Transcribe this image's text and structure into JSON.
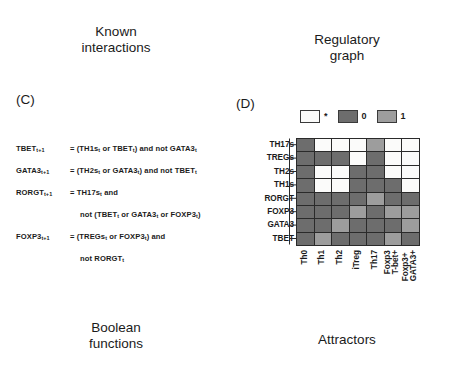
{
  "captions": {
    "known_interactions": "Known\ninteractions",
    "regulatory_graph": "Regulatory\ngraph",
    "boolean_functions": "Boolean\nfunctions",
    "attractors": "Attractors"
  },
  "panels": {
    "c_letter": "(C)",
    "d_letter": "(D)"
  },
  "boolean_functions": [
    {
      "lhs": "TBET",
      "lhs_sub": "t+1",
      "rhs": "= (TH1s<sub>t</sub> or TBET<sub>t</sub>) and not GATA3<sub>t</sub>",
      "continuation": null
    },
    {
      "lhs": "GATA3",
      "lhs_sub": "t+1",
      "rhs": "= (TH2s<sub>t</sub> or GATA3<sub>t</sub>) and not TBET<sub>t</sub>",
      "continuation": null
    },
    {
      "lhs": "RORGT",
      "lhs_sub": "t+1",
      "rhs": "= TH17s<sub>t</sub> and",
      "continuation": "not (TBET<sub>t</sub> or GATA3<sub>t</sub> or FOXP3<sub>t</sub>)"
    },
    {
      "lhs": "FOXP3",
      "lhs_sub": "t+1",
      "rhs": "= (TREGs<sub>t</sub> or FOXP3<sub>t</sub>) and",
      "continuation": "not RORGT<sub>t</sub>"
    }
  ],
  "legend": {
    "items": [
      {
        "label": "*",
        "state": "star",
        "color": "#fbfbfa"
      },
      {
        "label": "0",
        "state": "zero",
        "color": "#6d6d6d"
      },
      {
        "label": "1",
        "state": "one",
        "color": "#9d9d9d"
      }
    ]
  },
  "colors": {
    "star": "#fbfbfa",
    "zero": "#6d6d6d",
    "one": "#9d9d9d",
    "grid_line": "#2a2a2a",
    "text": "#1b1b1b"
  },
  "chart_data": {
    "type": "heatmap",
    "title": "Attractors",
    "xlabel": "",
    "ylabel": "",
    "legend_position": "top",
    "value_labels": {
      "star": "*",
      "zero": "0",
      "one": "1"
    },
    "row_labels": [
      "TH17s",
      "TREGs",
      "TH2s",
      "TH1s",
      "RORGT",
      "FOXP3",
      "GATA3",
      "TBET"
    ],
    "column_labels": [
      "Th0",
      "Th1",
      "Th2",
      "iTreg",
      "Th17",
      "Foxp3\nT-bet+",
      "Foxp3+\nGATA3+"
    ],
    "values": [
      [
        "0",
        "*",
        "*",
        "*",
        "1",
        "*",
        "*"
      ],
      [
        "0",
        "0",
        "0",
        "*",
        "0",
        "*",
        "*"
      ],
      [
        "0",
        "*",
        "*",
        "0",
        "0",
        "*",
        "*"
      ],
      [
        "0",
        "*",
        "*",
        "0",
        "0",
        "0",
        "*"
      ],
      [
        "0",
        "0",
        "0",
        "0",
        "1",
        "0",
        "0"
      ],
      [
        "0",
        "0",
        "0",
        "1",
        "0",
        "1",
        "1"
      ],
      [
        "0",
        "0",
        "1",
        "0",
        "0",
        "0",
        "1"
      ],
      [
        "0",
        "1",
        "0",
        "0",
        "0",
        "1",
        "0"
      ]
    ]
  }
}
